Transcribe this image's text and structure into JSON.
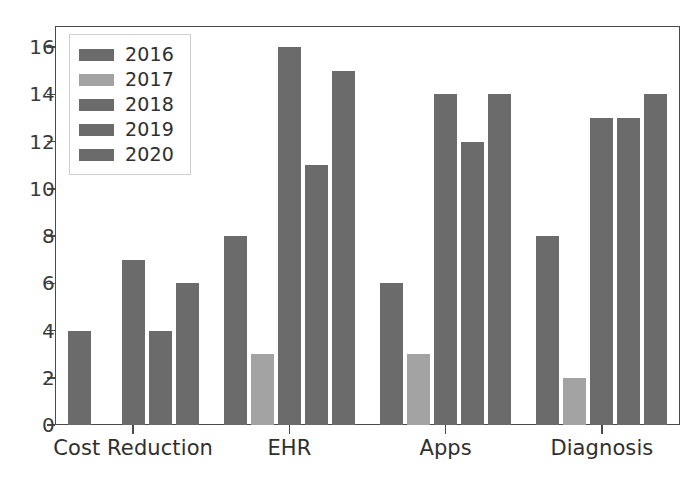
{
  "chart_data": {
    "type": "bar",
    "title": "",
    "subtitle": "",
    "xlabel": "",
    "ylabel": "",
    "categories": [
      "Cost Reduction",
      "EHR",
      "Apps",
      "Diagnosis"
    ],
    "series": [
      {
        "name": "2016",
        "color": "#6b6b6b",
        "values": [
          4,
          8,
          6,
          8
        ]
      },
      {
        "name": "2017",
        "color": "#a3a3a3",
        "values": [
          0,
          3,
          3,
          2
        ]
      },
      {
        "name": "2018",
        "color": "#6b6b6b",
        "values": [
          7,
          16,
          14,
          13
        ]
      },
      {
        "name": "2019",
        "color": "#6b6b6b",
        "values": [
          4,
          11,
          12,
          13
        ]
      },
      {
        "name": "2020",
        "color": "#6b6b6b",
        "values": [
          6,
          15,
          14,
          14
        ]
      }
    ],
    "ylim": [
      0,
      16.9
    ],
    "yticks": [
      0,
      2,
      4,
      6,
      8,
      10,
      12,
      14,
      16
    ],
    "ytick_labels": [
      "0",
      "2",
      "4",
      "6",
      "8",
      "10",
      "12",
      "14",
      "16"
    ],
    "grid": false,
    "legend_position": "upper left",
    "axis_color": "#4a4a4a",
    "background": "#ffffff"
  },
  "legend": {
    "entries": [
      {
        "label": "2016"
      },
      {
        "label": "2017"
      },
      {
        "label": "2018"
      },
      {
        "label": "2019"
      },
      {
        "label": "2020"
      }
    ]
  }
}
